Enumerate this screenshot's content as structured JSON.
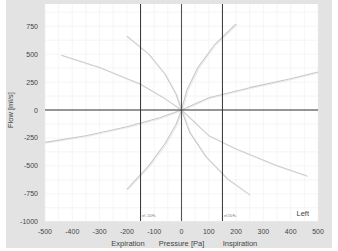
{
  "chart_data": {
    "type": "line",
    "title": "",
    "xlabel": "Pressure [Pa]",
    "ylabel": "Flow [ml/s]",
    "xlabel_left": "Expiration",
    "xlabel_right": "Inspiration",
    "corner_label": "Left",
    "xlim": [
      -500,
      500
    ],
    "ylim": [
      -1000,
      940
    ],
    "xticks": [
      -500,
      -400,
      -300,
      -200,
      -100,
      0,
      100,
      200,
      300,
      400,
      500
    ],
    "yticks": [
      750,
      500,
      250,
      0,
      -250,
      -500,
      -750,
      -1000
    ],
    "grid": true,
    "reference_lines_x": [
      -150,
      0,
      150
    ],
    "reference_lines_y": [
      0
    ],
    "series": [
      {
        "name": "curve-1",
        "x": [
          -440,
          -300,
          -150,
          -60,
          0
        ],
        "y": [
          490,
          380,
          230,
          100,
          0
        ]
      },
      {
        "name": "curve-2",
        "x": [
          -200,
          -120,
          -60,
          -20,
          0
        ],
        "y": [
          660,
          500,
          320,
          140,
          0
        ]
      },
      {
        "name": "curve-3",
        "x": [
          0,
          20,
          60,
          120,
          200
        ],
        "y": [
          0,
          180,
          380,
          580,
          770
        ]
      },
      {
        "name": "curve-4",
        "x": [
          0,
          100,
          250,
          400,
          500
        ],
        "y": [
          0,
          110,
          200,
          280,
          340
        ]
      },
      {
        "name": "curve-5",
        "x": [
          -500,
          -350,
          -200,
          -80,
          0
        ],
        "y": [
          -290,
          -230,
          -150,
          -70,
          0
        ]
      },
      {
        "name": "curve-6",
        "x": [
          -200,
          -120,
          -60,
          -20,
          0
        ],
        "y": [
          -710,
          -500,
          -300,
          -130,
          0
        ]
      },
      {
        "name": "curve-7",
        "x": [
          0,
          30,
          90,
          170,
          250
        ],
        "y": [
          0,
          -200,
          -420,
          -620,
          -760
        ]
      },
      {
        "name": "curve-8",
        "x": [
          0,
          100,
          200,
          350,
          460
        ],
        "y": [
          0,
          -230,
          -350,
          -500,
          -590
        ]
      }
    ]
  }
}
